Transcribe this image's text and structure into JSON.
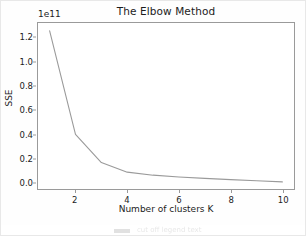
{
  "chart_data": {
    "type": "line",
    "title": "The Elbow Method",
    "xlabel": "Number of clusters K",
    "ylabel": "SSE",
    "y_offset_text": "1e11",
    "y_offset_multiplier": 100000000000.0,
    "x": [
      1,
      2,
      3,
      4,
      5,
      6,
      7,
      8,
      9,
      10
    ],
    "values": [
      1.26,
      0.4,
      0.165,
      0.085,
      0.06,
      0.045,
      0.033,
      0.023,
      0.013,
      0.004
    ],
    "series": [
      {
        "name": "SSE",
        "values": [
          1.26,
          0.4,
          0.165,
          0.085,
          0.06,
          0.045,
          0.033,
          0.023,
          0.013,
          0.004
        ]
      }
    ],
    "xlim": [
      0.55,
      10.45
    ],
    "ylim": [
      -0.055,
      1.325
    ],
    "xticks": [
      2,
      4,
      6,
      8,
      10
    ],
    "xtick_labels": [
      "2",
      "4",
      "6",
      "8",
      "10"
    ],
    "yticks": [
      0.0,
      0.2,
      0.4,
      0.6,
      0.8,
      1.0,
      1.2
    ],
    "ytick_labels": [
      "0.0",
      "0.2",
      "0.4",
      "0.6",
      "0.8",
      "1.0",
      "1.2"
    ],
    "grid": false,
    "legend": false,
    "line_color": "#9a9a9a",
    "line_width": 1.1
  },
  "figure": {
    "background_color": "#fefefe",
    "axes_color": "#9a9a9a",
    "text_color": "#1c1c1c"
  },
  "bottom_strip": {
    "caption": "cut off legend text"
  }
}
